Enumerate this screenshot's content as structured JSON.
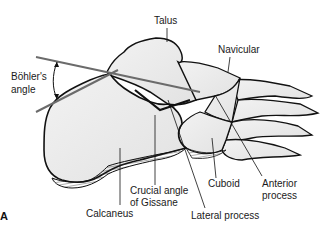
{
  "figure": {
    "panel_label": "A",
    "labels": {
      "talus": "Talus",
      "navicular": "Navicular",
      "bohlers_angle_line1": "Böhler's",
      "bohlers_angle_line2": "angle",
      "calcaneus": "Calcaneus",
      "crucial_angle_line1": "Crucial angle",
      "crucial_angle_line2": "of Gissane",
      "cuboid": "Cuboid",
      "anterior_process_line1": "Anterior",
      "anterior_process_line2": "process",
      "lateral_process": "Lateral process"
    },
    "colors": {
      "outline": "#111111",
      "bone_fill": "#eeeeee",
      "angle_line": "#6b6b6b",
      "hatch": "#333333"
    }
  }
}
